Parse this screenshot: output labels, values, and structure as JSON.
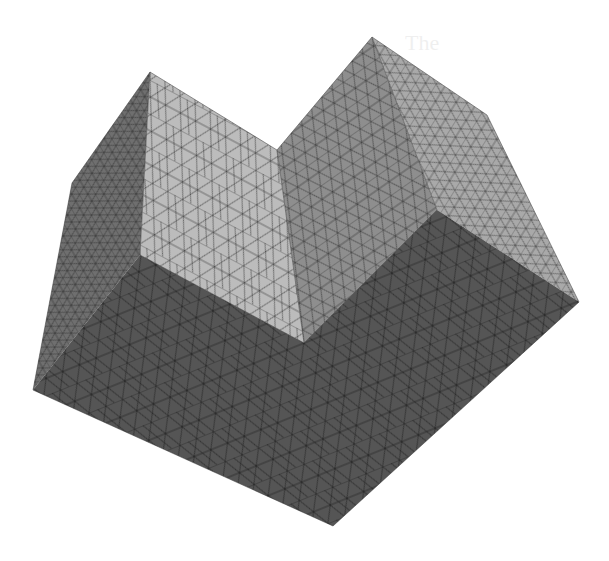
{
  "figure": {
    "background": "#ffffff",
    "bleed_text": [
      "The"
    ],
    "faces": [
      {
        "name": "left-block-outer-face",
        "fill": "#6f6f6f",
        "points": "72,183 150,72 140,255 33,390"
      },
      {
        "name": "left-block-front-face",
        "fill": "#bcbcbc",
        "points": "150,72 277,150 304,343 140,255"
      },
      {
        "name": "right-block-inner-wall",
        "fill": "#8e8e8e",
        "points": "277,150 372,37 437,210 304,343"
      },
      {
        "name": "right-block-side-face",
        "fill": "#a9a9a9",
        "points": "372,37 487,115 579,302 437,210"
      },
      {
        "name": "bottom-face",
        "fill": "#555555",
        "points": "33,390 140,255 304,343 437,210 579,302 333,526"
      }
    ],
    "mesh_line_color": "#2a2a2a"
  }
}
